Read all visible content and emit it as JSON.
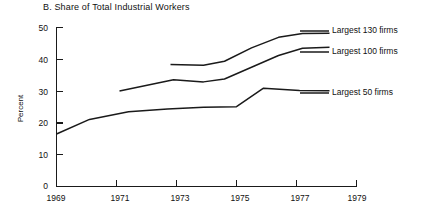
{
  "chart_data": {
    "type": "line",
    "title": "B. Share of Total Industrial Workers",
    "xlabel": "",
    "ylabel": "Percent",
    "xlim": [
      1969,
      1979
    ],
    "ylim": [
      0,
      50
    ],
    "xticks": [
      "1969",
      "1971",
      "1973",
      "1975",
      "1977",
      "1979"
    ],
    "xtick_values": [
      1969,
      1971,
      1973,
      1975,
      1977,
      1979
    ],
    "yticks": [
      "0",
      "10",
      "20",
      "30",
      "40",
      "50"
    ],
    "ytick_values": [
      0,
      10,
      20,
      30,
      40,
      50
    ],
    "grid": false,
    "legend_position": "right",
    "series": [
      {
        "name": "Largest 130 firms",
        "x": [
          1972.8,
          1973.9,
          1974.6,
          1975.5,
          1976.4,
          1977.2,
          1978.1
        ],
        "values": [
          38.4,
          38.1,
          39.4,
          43.6,
          46.9,
          48.1,
          48.2
        ]
      },
      {
        "name": "Largest 100 firms",
        "x": [
          1971.1,
          1972.9,
          1973.9,
          1974.6,
          1975.5,
          1976.4,
          1977.2,
          1978.1
        ],
        "values": [
          30.0,
          33.6,
          32.9,
          33.8,
          37.5,
          41.2,
          43.5,
          43.8
        ]
      },
      {
        "name": "Largest 50 firms",
        "x": [
          1969.0,
          1970.1,
          1971.4,
          1972.7,
          1973.9,
          1975.0,
          1975.9,
          1977.1,
          1978.1
        ],
        "values": [
          16.5,
          21.1,
          23.5,
          24.4,
          24.9,
          25.1,
          30.9,
          30.2,
          30.1
        ]
      }
    ]
  },
  "legend": {
    "items": [
      {
        "label": "Largest 130 firms"
      },
      {
        "label": "Largest 100 firms"
      },
      {
        "label": "Largest 50 firms"
      }
    ]
  }
}
